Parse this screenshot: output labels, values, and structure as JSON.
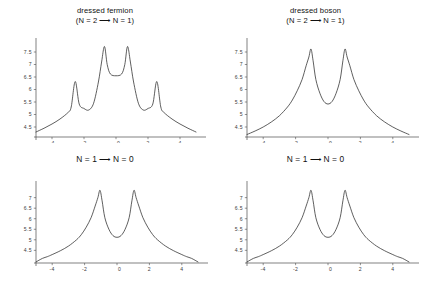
{
  "figure": {
    "background": "#ffffff",
    "curve_color": "#2a2a2a",
    "axis_color": "#4a4a4a",
    "panel_count": 4
  },
  "panels": [
    {
      "id": "top-left",
      "title_line1": "dressed fermion",
      "title_line2": "(N = 2 ⟶ N = 1)",
      "title": "dressed fermion\n(N = 2 ⟶ N = 1)"
    },
    {
      "id": "top-right",
      "title_line1": "dressed boson",
      "title_line2": "(N = 2 ⟶ N = 1)",
      "title": "dressed boson\n(N = 2 ⟶ N = 1)"
    },
    {
      "id": "bottom-left",
      "title_line1": "N = 1 ⟶ N = 0",
      "title_line2": "",
      "title": "N = 1 ⟶ N = 0"
    },
    {
      "id": "bottom-right",
      "title_line1": "N = 1 ⟶ N = 0",
      "title_line2": "",
      "title": "N = 1 ⟶ N = 0"
    }
  ],
  "chart_data": [
    {
      "type": "line",
      "panel": "top-left",
      "title": "dressed fermion (N = 2 → N = 1)",
      "xlabel": "",
      "ylabel": "",
      "xlim": [
        -5.0,
        5.0
      ],
      "ylim": [
        4.1,
        7.9
      ],
      "xticks": [
        -4,
        -2,
        0,
        2,
        4
      ],
      "xtick_labels": [
        "-4",
        "-2",
        "0",
        "2",
        "4"
      ],
      "yticks": [
        4.5,
        5,
        5.5,
        6,
        6.5,
        7,
        7.5
      ],
      "ytick_labels": [
        "4.5",
        "5",
        "5.5",
        "6",
        "6.5",
        "7",
        "7.5"
      ],
      "grid": false,
      "legend": "none",
      "peaks": [
        {
          "x": -2.55,
          "y": 6.32
        },
        {
          "x": -0.72,
          "y": 7.72
        },
        {
          "x": 0.72,
          "y": 7.72
        },
        {
          "x": 2.55,
          "y": 6.32
        }
      ],
      "baseline": 4.35,
      "local_minima": [
        {
          "x": -1.7,
          "y": 5.18
        },
        {
          "x": 0.0,
          "y": 6.55
        },
        {
          "x": 1.7,
          "y": 5.18
        }
      ],
      "series": [
        {
          "name": "spectral density",
          "x": [
            -5.0,
            -4.5,
            -4.0,
            -3.5,
            -3.0,
            -2.8,
            -2.55,
            -2.3,
            -2.0,
            -1.7,
            -1.4,
            -1.1,
            -0.9,
            -0.72,
            -0.55,
            -0.35,
            0.0,
            0.35,
            0.55,
            0.72,
            0.9,
            1.1,
            1.4,
            1.7,
            2.0,
            2.3,
            2.55,
            2.8,
            3.0,
            3.5,
            4.0,
            4.5,
            5.0
          ],
          "values": [
            4.3,
            4.45,
            4.62,
            4.82,
            5.08,
            5.3,
            6.32,
            5.42,
            5.24,
            5.18,
            5.45,
            6.3,
            7.1,
            7.72,
            7.0,
            6.62,
            6.55,
            6.62,
            7.0,
            7.72,
            7.1,
            6.3,
            5.45,
            5.18,
            5.24,
            5.42,
            6.32,
            5.3,
            5.08,
            4.82,
            4.62,
            4.45,
            4.3
          ]
        }
      ]
    },
    {
      "type": "line",
      "panel": "top-right",
      "title": "dressed boson (N = 2 → N = 1)",
      "xlabel": "",
      "ylabel": "",
      "xlim": [
        -5.0,
        5.0
      ],
      "ylim": [
        4.1,
        7.9
      ],
      "xticks": [
        -4,
        -2,
        0,
        2,
        4
      ],
      "xtick_labels": [
        "-4",
        "-2",
        "0",
        "2",
        "4"
      ],
      "yticks": [
        4.5,
        5,
        5.5,
        6,
        6.5,
        7,
        7.5
      ],
      "ytick_labels": [
        "4.5",
        "5",
        "5.5",
        "6",
        "6.5",
        "7",
        "7.5"
      ],
      "grid": false,
      "legend": "none",
      "peaks": [
        {
          "x": -1.05,
          "y": 7.62
        },
        {
          "x": 1.05,
          "y": 7.62
        }
      ],
      "baseline": 4.2,
      "local_minima": [
        {
          "x": 0.0,
          "y": 5.42
        }
      ],
      "series": [
        {
          "name": "spectral density",
          "x": [
            -5.0,
            -4.5,
            -4.0,
            -3.5,
            -3.0,
            -2.5,
            -2.2,
            -1.9,
            -1.6,
            -1.35,
            -1.18,
            -1.05,
            -0.92,
            -0.75,
            -0.5,
            -0.25,
            0.0,
            0.25,
            0.5,
            0.75,
            0.92,
            1.05,
            1.18,
            1.35,
            1.6,
            1.9,
            2.2,
            2.5,
            3.0,
            3.5,
            4.0,
            4.5,
            5.0
          ],
          "values": [
            4.2,
            4.34,
            4.5,
            4.7,
            4.95,
            5.3,
            5.58,
            5.95,
            6.4,
            6.95,
            7.3,
            7.62,
            7.15,
            6.4,
            5.85,
            5.52,
            5.42,
            5.52,
            5.85,
            6.4,
            7.15,
            7.62,
            7.3,
            6.95,
            6.4,
            5.95,
            5.58,
            5.3,
            4.95,
            4.7,
            4.5,
            4.34,
            4.2
          ]
        }
      ]
    },
    {
      "type": "line",
      "panel": "bottom-left",
      "title": "N = 1 → N = 0",
      "xlabel": "",
      "ylabel": "",
      "xlim": [
        -5.0,
        5.0
      ],
      "ylim": [
        3.9,
        7.6
      ],
      "xticks": [
        -4,
        -2,
        0,
        2,
        4
      ],
      "xtick_labels": [
        "-4",
        "-2",
        "0",
        "2",
        "4"
      ],
      "yticks": [
        4.5,
        5,
        5.5,
        6,
        6.5,
        7
      ],
      "ytick_labels": [
        "4.5",
        "5",
        "5.5",
        "6",
        "6.5",
        "7"
      ],
      "grid": false,
      "legend": "none",
      "peaks": [
        {
          "x": -1.05,
          "y": 7.35
        },
        {
          "x": 1.05,
          "y": 7.35
        }
      ],
      "baseline": 3.95,
      "local_minima": [
        {
          "x": 0.0,
          "y": 5.12
        }
      ],
      "axis_crossing": [
        -4.3,
        4.3
      ],
      "series": [
        {
          "name": "spectral density",
          "x": [
            -5.0,
            -4.6,
            -4.3,
            -4.0,
            -3.5,
            -3.0,
            -2.5,
            -2.2,
            -1.9,
            -1.6,
            -1.35,
            -1.18,
            -1.05,
            -0.92,
            -0.75,
            -0.5,
            -0.25,
            0.0,
            0.25,
            0.5,
            0.75,
            0.92,
            1.05,
            1.18,
            1.35,
            1.6,
            1.9,
            2.2,
            2.5,
            3.0,
            3.5,
            4.0,
            4.3,
            4.6,
            5.0
          ],
          "values": [
            3.95,
            4.12,
            4.2,
            4.3,
            4.48,
            4.7,
            5.0,
            5.25,
            5.6,
            6.05,
            6.6,
            7.0,
            7.35,
            6.85,
            6.05,
            5.5,
            5.2,
            5.12,
            5.2,
            5.5,
            6.05,
            6.85,
            7.35,
            7.0,
            6.6,
            6.05,
            5.6,
            5.25,
            5.0,
            4.7,
            4.48,
            4.3,
            4.2,
            4.12,
            3.95
          ]
        }
      ]
    },
    {
      "type": "line",
      "panel": "bottom-right",
      "title": "N = 1 → N = 0",
      "xlabel": "",
      "ylabel": "",
      "xlim": [
        -5.0,
        5.0
      ],
      "ylim": [
        3.9,
        7.6
      ],
      "xticks": [
        -4,
        -2,
        0,
        2,
        4
      ],
      "xtick_labels": [
        "-4",
        "-2",
        "0",
        "2",
        "4"
      ],
      "yticks": [
        4.5,
        5,
        5.5,
        6,
        6.5,
        7
      ],
      "ytick_labels": [
        "4.5",
        "5",
        "5.5",
        "6",
        "6.5",
        "7"
      ],
      "grid": false,
      "legend": "none",
      "peaks": [
        {
          "x": -1.05,
          "y": 7.35
        },
        {
          "x": 1.05,
          "y": 7.35
        }
      ],
      "baseline": 3.95,
      "local_minima": [
        {
          "x": 0.0,
          "y": 5.12
        }
      ],
      "axis_crossing": [
        -4.3,
        4.3
      ],
      "series": [
        {
          "name": "spectral density",
          "x": [
            -5.0,
            -4.6,
            -4.3,
            -4.0,
            -3.5,
            -3.0,
            -2.5,
            -2.2,
            -1.9,
            -1.6,
            -1.35,
            -1.18,
            -1.05,
            -0.92,
            -0.75,
            -0.5,
            -0.25,
            0.0,
            0.25,
            0.5,
            0.75,
            0.92,
            1.05,
            1.18,
            1.35,
            1.6,
            1.9,
            2.2,
            2.5,
            3.0,
            3.5,
            4.0,
            4.3,
            4.6,
            5.0
          ],
          "values": [
            3.95,
            4.12,
            4.2,
            4.3,
            4.48,
            4.7,
            5.0,
            5.25,
            5.6,
            6.05,
            6.6,
            7.0,
            7.35,
            6.85,
            6.05,
            5.5,
            5.2,
            5.12,
            5.2,
            5.5,
            6.05,
            6.85,
            7.35,
            7.0,
            6.6,
            6.05,
            5.6,
            5.25,
            5.0,
            4.7,
            4.48,
            4.3,
            4.2,
            4.12,
            3.95
          ]
        }
      ]
    }
  ]
}
